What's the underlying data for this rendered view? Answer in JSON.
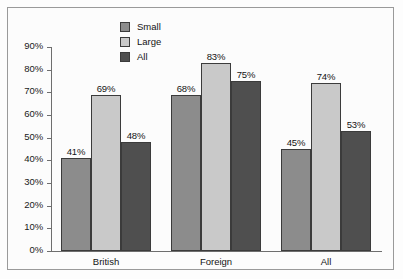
{
  "chart_data": {
    "type": "bar",
    "title": "",
    "xlabel": "",
    "ylabel": "",
    "categories": [
      "British",
      "Foreign",
      "All"
    ],
    "series": [
      {
        "name": "Small",
        "values": [
          41,
          69,
          45
        ],
        "color": "#8c8c8c"
      },
      {
        "name": "Large",
        "values": [
          69,
          83,
          74
        ],
        "color": "#c9c9c9"
      },
      {
        "name": "All",
        "values": [
          48,
          75,
          53
        ],
        "color": "#4f4f4f"
      }
    ],
    "value_labels": [
      [
        "41%",
        "69%",
        "48%"
      ],
      [
        "68%",
        "83%",
        "75%"
      ],
      [
        "45%",
        "74%",
        "53%"
      ]
    ],
    "ylim": [
      0,
      90
    ],
    "ytick_values": [
      0,
      10,
      20,
      30,
      40,
      50,
      60,
      70,
      80,
      90
    ],
    "ytick_labels": [
      "0%",
      "10%",
      "20%",
      "30%",
      "40%",
      "50%",
      "60%",
      "70%",
      "80%",
      "90%"
    ],
    "grid": false,
    "legend_position": "top-left-inside",
    "legend_entries": [
      "Small",
      "Large",
      "All"
    ]
  },
  "colors": {
    "small": "#8c8c8c",
    "large": "#c9c9c9",
    "all": "#4f4f4f",
    "axis": "#6e6e6e",
    "frame": "#9a9a9a",
    "text": "#141414",
    "plot_background": "#fcfcfc"
  }
}
